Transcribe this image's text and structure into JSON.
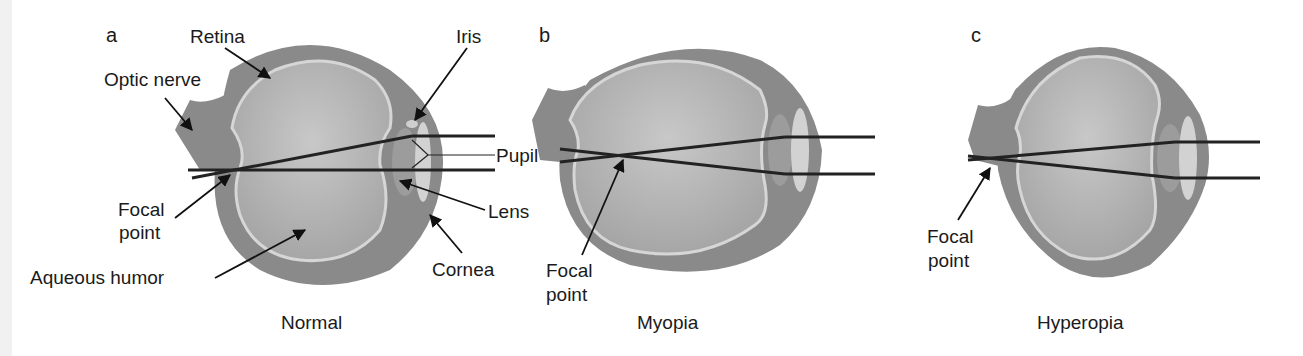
{
  "figure": {
    "panels": [
      {
        "letter": "a",
        "caption": "Normal",
        "labels": {
          "retina": "Retina",
          "optic_nerve": "Optic nerve",
          "iris": "Iris",
          "pupil": "Pupil",
          "lens": "Lens",
          "cornea": "Cornea",
          "focal_point_line1": "Focal",
          "focal_point_line2": "point",
          "aqueous_humor": "Aqueous humor"
        }
      },
      {
        "letter": "b",
        "caption": "Myopia",
        "labels": {
          "focal_point_line1": "Focal",
          "focal_point_line2": "point"
        }
      },
      {
        "letter": "c",
        "caption": "Hyperopia",
        "labels": {
          "focal_point_line1": "Focal",
          "focal_point_line2": "point"
        }
      }
    ],
    "colors": {
      "sclera": "#8a8a8a",
      "inner_eye": "#b4b4b4",
      "retina_line": "#d6d6d6",
      "lens": "#c9c9c9",
      "ray": "#222222",
      "text": "#1a1a1a"
    }
  }
}
